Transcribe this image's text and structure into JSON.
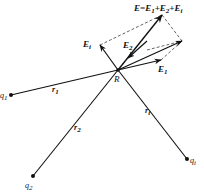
{
  "diagram": {
    "title_equation": {
      "lhs": "E",
      "eq": "=",
      "terms": [
        {
          "base": "E",
          "sub": "1"
        },
        {
          "base": "E",
          "sub": "2"
        },
        {
          "base": "E",
          "sub": "i"
        }
      ],
      "plus": "+"
    },
    "point_R": {
      "label": "R",
      "x": 118,
      "y": 70
    },
    "charges": [
      {
        "id": "q1",
        "base": "q",
        "sub": "1",
        "x": 11,
        "y": 95
      },
      {
        "id": "q2",
        "base": "q",
        "sub": "2",
        "x": 33,
        "y": 176
      },
      {
        "id": "qi",
        "base": "q",
        "sub": "i",
        "x": 187,
        "y": 159
      }
    ],
    "distances": [
      {
        "id": "r1",
        "base": "r",
        "sub": "1"
      },
      {
        "id": "r2",
        "base": "r",
        "sub": "2"
      },
      {
        "id": "ri",
        "base": "r",
        "sub": "i"
      }
    ],
    "field_vectors": [
      {
        "id": "E1",
        "base": "E",
        "sub": "1",
        "tip_x": 161,
        "tip_y": 60
      },
      {
        "id": "E2",
        "base": "E",
        "sub": "2",
        "tip_x": 132,
        "tip_y": 55
      },
      {
        "id": "Ei",
        "base": "E",
        "sub": "i",
        "tip_x": 100,
        "tip_y": 45
      },
      {
        "id": "E1_plus_E2",
        "tip_x": 182,
        "tip_y": 41
      },
      {
        "id": "E_total",
        "base": "E",
        "tip_x": 162,
        "tip_y": 15
      }
    ],
    "colors": {
      "ink": "#111111",
      "background": "#ffffff"
    }
  }
}
